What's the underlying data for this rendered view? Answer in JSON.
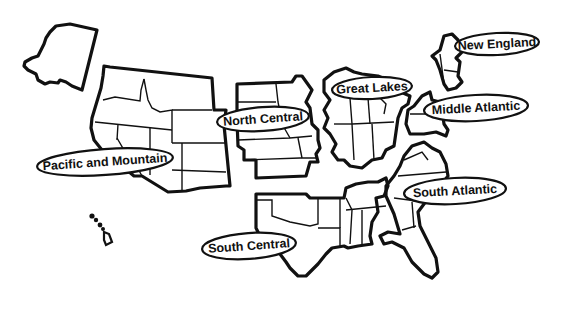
{
  "map": {
    "type": "US census regions outline map",
    "colors": {
      "stroke": "#111111",
      "background": "#ffffff"
    },
    "regions": [
      {
        "id": "pacific-mountain",
        "label": "Pacific and Mountain"
      },
      {
        "id": "north-central",
        "label": "North Central"
      },
      {
        "id": "great-lakes",
        "label": "Great Lakes"
      },
      {
        "id": "new-england",
        "label": "New England"
      },
      {
        "id": "middle-atlantic",
        "label": "Middle Atlantic"
      },
      {
        "id": "south-atlantic",
        "label": "South Atlantic"
      },
      {
        "id": "south-central",
        "label": "South Central"
      }
    ]
  }
}
